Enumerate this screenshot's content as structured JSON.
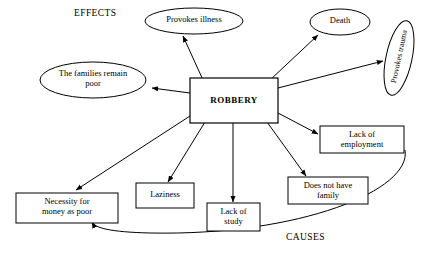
{
  "diagram": {
    "title_effects": "EFFECTS",
    "title_causes": "CAUSES",
    "center": {
      "label": "ROBBERY",
      "shape": "rectangle"
    },
    "nodes": [
      {
        "id": "provokes-illness",
        "label": "Provokes illness",
        "shape": "ellipse",
        "group": "effects"
      },
      {
        "id": "death",
        "label": "Death",
        "shape": "ellipse",
        "group": "effects"
      },
      {
        "id": "provokes-trauma",
        "label": "Provokes trauma",
        "shape": "ellipse",
        "group": "effects",
        "rotated": true
      },
      {
        "id": "families-remain-poor",
        "label": "The families remain\npoor",
        "shape": "ellipse",
        "group": "effects"
      },
      {
        "id": "lack-of-employment",
        "label": "Lack of\nemployment",
        "shape": "rectangle",
        "group": "causes"
      },
      {
        "id": "does-not-have-family",
        "label": "Does not have\nfamily",
        "shape": "rectangle",
        "group": "causes"
      },
      {
        "id": "lack-of-study",
        "label": "Lack of\nstudy",
        "shape": "rectangle",
        "group": "causes"
      },
      {
        "id": "laziness",
        "label": "Laziness",
        "shape": "rectangle",
        "group": "causes"
      },
      {
        "id": "necessity-for-money",
        "label": "Necessity for\nmoney  as poor",
        "shape": "rectangle",
        "group": "causes"
      }
    ],
    "colors": {
      "stroke": "#000000",
      "fill": "#ffffff",
      "text": "#000000"
    }
  }
}
